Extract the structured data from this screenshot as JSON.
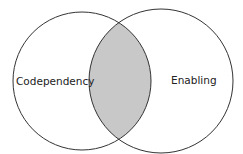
{
  "diagram": {
    "type": "venn",
    "sets": [
      {
        "label": "Codependency"
      },
      {
        "label": "Enabling"
      }
    ],
    "intersection_fill": "#c8c8c8",
    "stroke": "#333333"
  }
}
